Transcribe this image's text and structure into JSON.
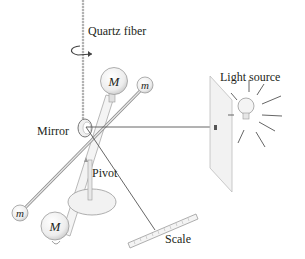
{
  "diagram": {
    "type": "Cavendish torsion balance apparatus",
    "labels": {
      "fiber": "Quartz fiber",
      "mirror": "Mirror",
      "pivot": "Pivot",
      "light": "Light source",
      "scale": "Scale"
    },
    "balls": {
      "large": "M",
      "small": "m"
    },
    "colors": {
      "line": "#555555",
      "ball_fill": "#eeeeee",
      "ball_stroke": "#9a9a9a",
      "panel_fill": "#f2f2f2",
      "text": "#231f20"
    }
  }
}
